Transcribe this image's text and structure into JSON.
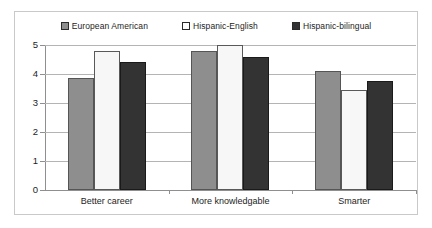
{
  "chart_data": {
    "type": "bar",
    "title": "",
    "xlabel": "",
    "ylabel": "",
    "ylim": [
      0,
      5
    ],
    "yticks": [
      "0",
      "1",
      "2",
      "3",
      "4",
      "5"
    ],
    "grid": true,
    "legend_position": "top-center",
    "categories": [
      "Better career",
      "More knowledgable",
      "Smarter"
    ],
    "series": [
      {
        "name": "European American",
        "swatch": "sw-gray",
        "color": "#8e8e8e",
        "values": [
          3.85,
          4.8,
          4.1
        ]
      },
      {
        "name": "Hispanic-English",
        "swatch": "sw-white",
        "color": "#ffffff",
        "values": [
          4.8,
          5.0,
          3.45
        ]
      },
      {
        "name": "Hispanic-bilingual",
        "swatch": "sw-dark",
        "color": "#333333",
        "values": [
          4.4,
          4.6,
          3.75
        ]
      }
    ]
  }
}
